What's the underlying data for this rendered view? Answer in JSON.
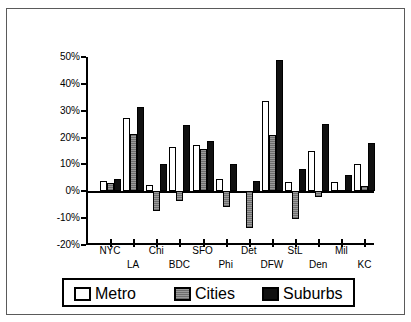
{
  "chart_data": {
    "type": "bar",
    "title": "",
    "subtitle": "",
    "xlabel": "",
    "ylabel": "",
    "ylim": [
      -20,
      50
    ],
    "ytick_labels": [
      "50%",
      "40%",
      "30%",
      "20%",
      "10%",
      "0%",
      "-10%",
      "-20%"
    ],
    "ytick_values": [
      50,
      40,
      30,
      20,
      10,
      0,
      -10,
      -20
    ],
    "grid": false,
    "legend_position": "bottom",
    "categories": [
      "NYC",
      "LA",
      "Chi",
      "BDC",
      "SFO",
      "Phi",
      "Det",
      "DFW",
      "StL",
      "Den",
      "Mil",
      "KC"
    ],
    "series": [
      {
        "name": "Metro",
        "color": "#ffffff",
        "values": [
          3.8,
          27.3,
          2.3,
          16.5,
          17.3,
          4.7,
          0,
          33.5,
          3.6,
          15.0,
          3.4,
          10.3
        ]
      },
      {
        "name": "Cities",
        "color": "#8d8d8d",
        "values": [
          3.0,
          21.3,
          -7.3,
          -3.8,
          15.7,
          -6.0,
          -13.5,
          21.1,
          -10.3,
          -2.2,
          0.5,
          1.8
        ]
      },
      {
        "name": "Suburbs",
        "color": "#111111",
        "values": [
          4.4,
          31.2,
          10.0,
          24.7,
          18.6,
          10.0,
          3.9,
          48.9,
          8.2,
          25.0,
          6.0,
          17.9
        ]
      }
    ]
  },
  "legend": {
    "items": [
      {
        "label": "Metro",
        "key": "metro"
      },
      {
        "label": "Cities",
        "key": "cities"
      },
      {
        "label": "Suburbs",
        "key": "suburbs"
      }
    ]
  }
}
